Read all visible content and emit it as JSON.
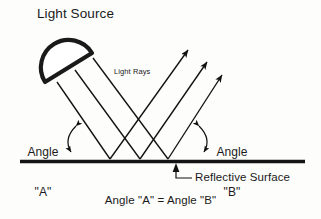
{
  "diagram": {
    "title": "Light Source",
    "labels": {
      "light_rays": "Light Rays",
      "angle_a_line1": "Angle",
      "angle_a_line2": "\"A\"",
      "angle_b_line1": "Angle",
      "angle_b_line2": "\"B\"",
      "reflective_surface": "Reflective Surface",
      "equation": "Angle \"A\" = Angle \"B\""
    },
    "colors": {
      "ink": "#1a1a1a",
      "stroke": "#111111",
      "background": "#fdfdfc",
      "surface": "#141414"
    },
    "icons": {
      "lamp": "lamp-half-dome-icon",
      "incident_ray": "incident-ray-arrow-icon",
      "reflected_ray": "reflected-ray-arrow-icon",
      "angle_arc": "angle-arc-double-arrow-icon",
      "leader": "leader-line-icon",
      "surface": "reflective-surface-line-icon"
    },
    "geometry": {
      "surface_y": 161,
      "surface_x_start": 20,
      "surface_x_end": 305,
      "reflection_points": [
        110,
        140,
        168
      ],
      "incident_start_points": [
        [
          62,
          78
        ],
        [
          78,
          70
        ],
        [
          95,
          61
        ]
      ],
      "reflected_tip_points": [
        [
          188,
          50
        ],
        [
          207,
          62
        ],
        [
          222,
          75
        ]
      ],
      "angle_a_degrees": 52,
      "angle_b_degrees": 52
    }
  }
}
